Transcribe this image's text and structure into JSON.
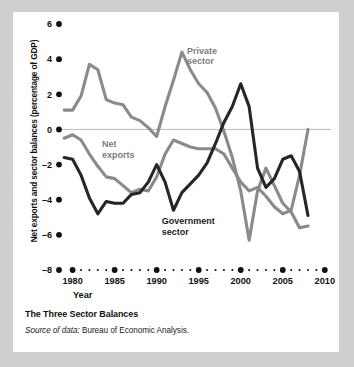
{
  "figure": {
    "caption_title": "The Three Sector Balances",
    "source_prefix": "Source of data:",
    "source_text": " Bureau of Economic Analysis."
  },
  "chart_data": {
    "type": "line",
    "title": "The Three Sector Balances",
    "xlabel": "Year",
    "ylabel": "Net exports and sector balances (percentage of GDP)",
    "xlim": [
      1978.5,
      2010.5
    ],
    "ylim": [
      -8,
      6
    ],
    "yticks": [
      6,
      4,
      2,
      0,
      -2,
      -4,
      -6,
      -8
    ],
    "ytick_labels": [
      "6",
      "4",
      "2",
      "0",
      "–2",
      "–4",
      "–6",
      "–8"
    ],
    "xticks": [
      1980,
      1985,
      1990,
      1995,
      2000,
      2005,
      2010
    ],
    "xtick_labels": [
      "1980",
      "1985",
      "1990",
      "1995",
      "2000",
      "2005",
      "2010"
    ],
    "grid": false,
    "zero_line": true,
    "legend": "inline-annotations",
    "annotations": [
      {
        "text": "Private sector",
        "line1": "Private",
        "line2": "sector",
        "x": 1993.6,
        "y": 4.3,
        "color": "#7d7d7d"
      },
      {
        "text": "Net exports",
        "line1": "Net",
        "line2": "exports",
        "x": 1983.5,
        "y": -1.0,
        "color": "#7d7d7d"
      },
      {
        "text": "Government sector",
        "line1": "Government",
        "line2": "sector",
        "x": 1990.6,
        "y": -5.4,
        "color": "#1c1c1c"
      }
    ],
    "colors": {
      "private_sector": "#8a8a8a",
      "net_exports": "#8a8a8a",
      "government_sector": "#262626",
      "axis": "#111111",
      "zero_line": "#b9b9b9",
      "background": "#ffffff",
      "page_background": "#cfcfcf"
    },
    "x": [
      1979,
      1980,
      1981,
      1982,
      1983,
      1984,
      1985,
      1986,
      1987,
      1988,
      1989,
      1990,
      1991,
      1992,
      1993,
      1994,
      1995,
      1996,
      1997,
      1998,
      1999,
      2000,
      2001,
      2002,
      2003,
      2004,
      2005,
      2006,
      2007,
      2008
    ],
    "series": [
      {
        "name": "Private sector",
        "color": "#8a8a8a",
        "values": [
          1.1,
          1.1,
          1.9,
          3.7,
          3.4,
          1.7,
          1.5,
          1.4,
          0.7,
          0.5,
          0.1,
          -0.4,
          1.3,
          2.8,
          4.4,
          3.4,
          2.6,
          2.1,
          1.2,
          -0.1,
          -1.6,
          -3.5,
          -6.3,
          -3.5,
          -2.2,
          -3.2,
          -4.2,
          -4.7,
          -5.6,
          -5.5
        ]
      },
      {
        "name": "Net exports",
        "color": "#8a8a8a",
        "values": [
          -0.5,
          -0.3,
          -0.6,
          -1.4,
          -2.1,
          -2.7,
          -2.8,
          -3.2,
          -3.6,
          -3.4,
          -3.5,
          -2.7,
          -1.4,
          -0.6,
          -0.8,
          -1.0,
          -1.1,
          -1.1,
          -1.1,
          -1.4,
          -2.2,
          -3.0,
          -3.5,
          -3.3,
          -3.8,
          -4.4,
          -4.8,
          -4.6,
          -2.6,
          0.0
        ]
      },
      {
        "name": "Government sector",
        "color": "#262626",
        "values": [
          -1.6,
          -1.7,
          -2.6,
          -3.9,
          -4.8,
          -4.1,
          -4.2,
          -4.2,
          -3.7,
          -3.6,
          -3.0,
          -2.0,
          -3.0,
          -4.6,
          -3.6,
          -3.1,
          -2.6,
          -1.9,
          -0.8,
          0.4,
          1.3,
          2.6,
          1.3,
          -2.2,
          -3.3,
          -2.8,
          -1.7,
          -1.5,
          -2.4,
          -4.9
        ]
      }
    ]
  }
}
